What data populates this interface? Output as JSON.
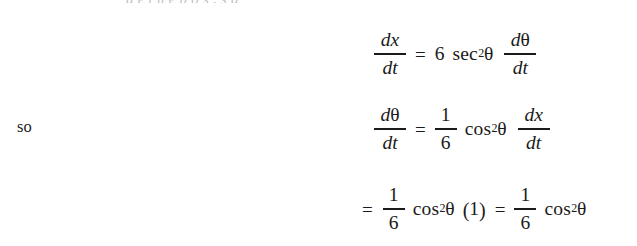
{
  "document": {
    "type": "textbook-derivation-excerpt",
    "background_color": "#ffffff",
    "text_color": "#1a1a1a",
    "cropped_top_line": "g      e  t   h  e   p  o     s  ,   s  g"
  },
  "margin_label": {
    "text": "so"
  },
  "equations": [
    {
      "id": "eq1",
      "lhs": {
        "numerator": {
          "d": "d",
          "var": "x"
        },
        "denominator": {
          "d": "d",
          "var": "t"
        }
      },
      "relation": "=",
      "rhs": {
        "coefficient": "6",
        "function": "sec",
        "exponent": "2",
        "argument": "θ",
        "derivative": {
          "numerator": {
            "d": "d",
            "var": "θ"
          },
          "denominator": {
            "d": "d",
            "var": "t"
          }
        }
      }
    },
    {
      "id": "eq2",
      "lhs": {
        "numerator": {
          "d": "d",
          "var": "θ"
        },
        "denominator": {
          "d": "d",
          "var": "t"
        }
      },
      "relation": "=",
      "rhs": {
        "fraction": {
          "numerator": "1",
          "denominator": "6"
        },
        "function": "cos",
        "exponent": "2",
        "argument": "θ",
        "derivative": {
          "numerator": {
            "d": "d",
            "var": "x"
          },
          "denominator": {
            "d": "d",
            "var": "t"
          }
        }
      }
    },
    {
      "id": "eq3",
      "relation_lead": "=",
      "first_term": {
        "fraction": {
          "numerator": "1",
          "denominator": "6"
        },
        "function": "cos",
        "exponent": "2",
        "argument": "θ",
        "factor_open": "(",
        "factor_value": "1",
        "factor_close": ")"
      },
      "relation_mid": "=",
      "second_term": {
        "fraction": {
          "numerator": "1",
          "denominator": "6"
        },
        "function": "cos",
        "exponent": "2",
        "argument": "θ"
      }
    }
  ]
}
